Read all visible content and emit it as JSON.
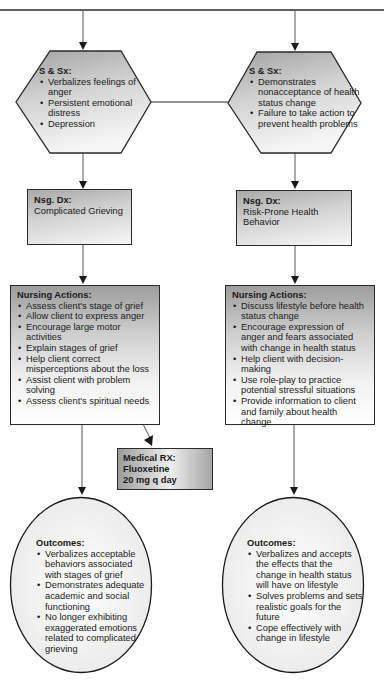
{
  "left_path": {
    "signs_symptoms": {
      "title": "S & Sx:",
      "items": [
        "Verbalizes feelings of anger",
        "Persistent emotional distress",
        "Depression"
      ]
    },
    "nursing_dx": {
      "title": "Nsg. Dx:",
      "text": "Complicated Grieving"
    },
    "nursing_actions": {
      "title": "Nursing Actions:",
      "items": [
        "Assess client's stage of grief",
        "Allow client to express anger",
        "Encourage large motor activities",
        "Explain stages of grief",
        "Help client correct misperceptions about the loss",
        "Assist client with problem solving",
        "Assess client's spiritual needs"
      ]
    },
    "medical_rx": {
      "title": "Medical RX:",
      "drug": "Fluoxetine",
      "dose": "20 mg q day"
    },
    "outcomes": {
      "title": "Outcomes:",
      "items": [
        "Verbalizes acceptable behaviors associated with stages of grief",
        "Demonstrates adequate academic and social functioning",
        "No longer exhibiting exaggerated emotions related to complicated grieving"
      ]
    }
  },
  "right_path": {
    "signs_symptoms": {
      "title": "S & Sx:",
      "items": [
        "Demonstrates nonacceptance of health status change",
        "Failure to take action to prevent health problems"
      ]
    },
    "nursing_dx": {
      "title": "Nsg. Dx:",
      "text": "Risk-Prone Health Behavior"
    },
    "nursing_actions": {
      "title": "Nursing Actions:",
      "items": [
        "Discuss lifestyle before health status change",
        "Encourage expression of anger and fears associated with change in health status",
        "Help client with decision-making",
        "Use role-play to practice potential stressful situations",
        "Provide information to client and family about health change"
      ]
    },
    "outcomes": {
      "title": "Outcomes:",
      "items": [
        "Verbalizes and accepts the effects that the change in health status will have on lifestyle",
        "Solves problems and sets realistic goals for the future",
        "Cope effectively with change in lifestyle"
      ]
    }
  },
  "colors": {
    "line": "#2b2b2b",
    "box_border": "#2b2b2b",
    "gradient_dark": "#9d9d9d",
    "gradient_light": "#f7f7f7",
    "oval_fill": "#f1f1f1"
  }
}
